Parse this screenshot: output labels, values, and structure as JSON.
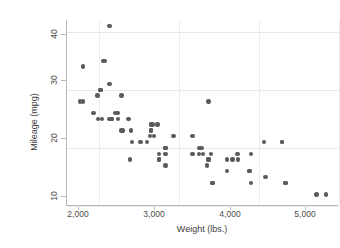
{
  "chart_data": {
    "type": "scatter",
    "title": "",
    "xlabel": "Weight (lbs.)",
    "ylabel": "Mileage (mpg)",
    "xlim": [
      1600,
      5000
    ],
    "ylim": [
      10,
      42
    ],
    "xticks": [
      2000,
      3000,
      4000,
      5000
    ],
    "xtick_labels": [
      "2,000",
      "3,000",
      "4,000",
      "5,000"
    ],
    "yticks": [
      10,
      20,
      30,
      40
    ],
    "ytick_labels": [
      "10",
      "20",
      "30",
      "40"
    ],
    "grid": "horizontal-and-vertical-faint",
    "legend": "none",
    "marker": {
      "shape": "circle",
      "color": "#5a5a5a",
      "size_px": 4.4
    },
    "series": [
      {
        "name": "Mileage vs Weight",
        "x": [
          2930,
          3350,
          2640,
          3250,
          4080,
          3670,
          2230,
          3280,
          3880,
          3400,
          4330,
          3900,
          4290,
          4330,
          3900,
          4290,
          3730,
          3370,
          2830,
          2070,
          2650,
          3370,
          2730,
          2830,
          1800,
          2050,
          2410,
          2200,
          2670,
          2370,
          2020,
          2280,
          2750,
          2130,
          2650,
          2600,
          4720,
          3420,
          3880,
          4060,
          3600,
          3600,
          3740,
          4840,
          3370,
          2830,
          2130,
          1760,
          2020,
          2280,
          2750,
          2130,
          2650,
          1800,
          1930,
          1990,
          3170,
          2690,
          3300,
          2160,
          3250,
          2240,
          2390,
          2520,
          2300,
          2160,
          1980,
          2830,
          3170,
          2650,
          2400,
          3420,
          2750,
          2040
        ],
        "y": [
          22,
          17,
          22,
          20,
          15,
          18,
          26,
          20,
          16,
          19,
          14,
          14,
          21,
          14,
          19,
          21,
          19,
          18,
          19,
          35,
          24,
          18,
          24,
          20,
          28,
          35,
          21,
          26,
          24,
          25,
          30,
          29,
          18,
          31,
          23,
          21,
          12,
          14,
          16,
          21,
          16,
          18,
          18,
          12,
          28,
          17,
          41,
          28,
          30,
          23,
          18,
          25,
          23,
          34,
          26,
          25,
          19,
          22,
          19,
          25,
          19,
          25,
          18,
          21,
          23,
          25,
          29,
          20,
          22,
          24,
          23,
          14,
          19,
          25
        ]
      }
    ],
    "n_points": 74
  }
}
